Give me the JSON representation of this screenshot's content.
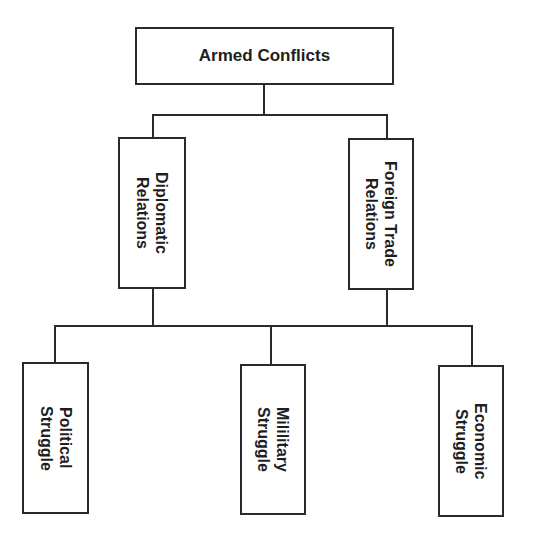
{
  "diagram": {
    "type": "hierarchy",
    "root": {
      "label": "Armed Conflicts"
    },
    "middle": [
      {
        "label": "Diplomatic\nRelations"
      },
      {
        "label": "Foreign Trade\nRelations"
      }
    ],
    "leaves": [
      {
        "label": "Political\nStruggle"
      },
      {
        "label": "Mililitary\nStruggle"
      },
      {
        "label": "Economic\nStruggle"
      }
    ],
    "colors": {
      "stroke": "#2a2a2a",
      "text": "#1e1e1e",
      "background": "#ffffff"
    }
  }
}
